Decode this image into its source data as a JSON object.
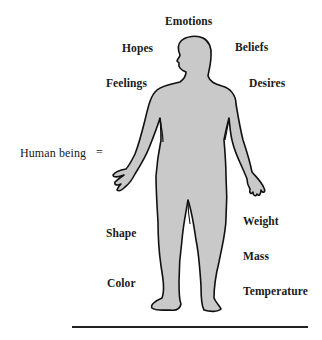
{
  "diagram": {
    "subject_label": "Human being",
    "equals_sign": "=",
    "inner_attributes": [
      {
        "id": "emotions",
        "label": "Emotions"
      },
      {
        "id": "hopes",
        "label": "Hopes"
      },
      {
        "id": "beliefs",
        "label": "Beliefs"
      },
      {
        "id": "feelings",
        "label": "Feelings"
      },
      {
        "id": "desires",
        "label": "Desires"
      }
    ],
    "physical_attributes": [
      {
        "id": "shape",
        "label": "Shape"
      },
      {
        "id": "color",
        "label": "Color"
      },
      {
        "id": "weight",
        "label": "Weight"
      },
      {
        "id": "mass",
        "label": "Mass"
      },
      {
        "id": "temperature",
        "label": "Temperature"
      }
    ],
    "figure": {
      "fill": "#c8c8c8",
      "stroke": "#111111"
    }
  }
}
